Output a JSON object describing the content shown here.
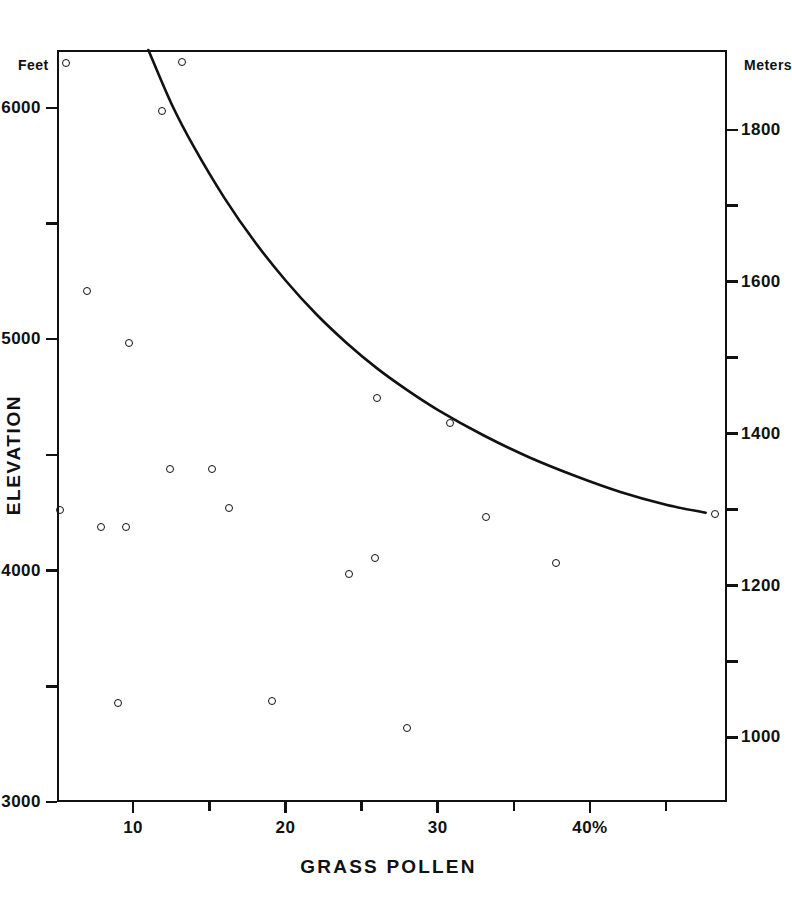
{
  "chart_data": {
    "type": "scatter",
    "title": "",
    "xlabel": "GRASS POLLEN",
    "ylabel": "ELEVATION",
    "x_unit_suffix": "%",
    "y_left_unit": "Feet",
    "y_right_unit": "Meters",
    "xlim": [
      5,
      49
    ],
    "ylim": [
      3000,
      6250
    ],
    "y_right_lim": [
      915,
      1905
    ],
    "grid": false,
    "legend": "none",
    "x_ticks": [
      10,
      20,
      30,
      40
    ],
    "x_tick_labels": [
      "10",
      "20",
      "30",
      "40%"
    ],
    "x_minor_ticks": [
      15,
      25,
      35,
      45
    ],
    "y_left_ticks": [
      3000,
      4000,
      5000,
      6000
    ],
    "y_left_tick_labels": [
      "3000",
      "4000",
      "5000",
      "6000"
    ],
    "y_left_minor_ticks": [
      3500,
      4500,
      5500
    ],
    "y_right_ticks": [
      1000,
      1200,
      1400,
      1600,
      1800
    ],
    "y_right_tick_labels": [
      "1000",
      "1200",
      "1400",
      "1600",
      "1800"
    ],
    "y_right_minor_ticks": [
      1100,
      1300,
      1500,
      1700
    ],
    "series": [
      {
        "name": "samples",
        "marker": "open-circle",
        "color": "#111111",
        "points": [
          {
            "x": 5.6,
            "y": 6195
          },
          {
            "x": 13.2,
            "y": 6200
          },
          {
            "x": 11.9,
            "y": 5985
          },
          {
            "x": 7.0,
            "y": 5210
          },
          {
            "x": 9.7,
            "y": 4985
          },
          {
            "x": 26.0,
            "y": 4745
          },
          {
            "x": 30.8,
            "y": 4640
          },
          {
            "x": 12.4,
            "y": 4440
          },
          {
            "x": 15.2,
            "y": 4440
          },
          {
            "x": 5.2,
            "y": 4260
          },
          {
            "x": 16.3,
            "y": 4270
          },
          {
            "x": 33.2,
            "y": 4230
          },
          {
            "x": 7.9,
            "y": 4190
          },
          {
            "x": 9.5,
            "y": 4190
          },
          {
            "x": 48.2,
            "y": 4245
          },
          {
            "x": 25.9,
            "y": 4055
          },
          {
            "x": 24.2,
            "y": 3985
          },
          {
            "x": 37.8,
            "y": 4035
          },
          {
            "x": 9.0,
            "y": 3430
          },
          {
            "x": 19.1,
            "y": 3435
          },
          {
            "x": 28.0,
            "y": 3320
          }
        ]
      }
    ],
    "trend_line": {
      "name": "fitted-curve",
      "color": "#111111",
      "points": [
        {
          "x": 11.0,
          "y": 6250
        },
        {
          "x": 12.5,
          "y": 6020
        },
        {
          "x": 14.0,
          "y": 5830
        },
        {
          "x": 16.0,
          "y": 5610
        },
        {
          "x": 18.0,
          "y": 5420
        },
        {
          "x": 20.0,
          "y": 5255
        },
        {
          "x": 22.0,
          "y": 5110
        },
        {
          "x": 24.0,
          "y": 4985
        },
        {
          "x": 26.0,
          "y": 4875
        },
        {
          "x": 28.0,
          "y": 4780
        },
        {
          "x": 30.0,
          "y": 4695
        },
        {
          "x": 33.0,
          "y": 4585
        },
        {
          "x": 36.0,
          "y": 4490
        },
        {
          "x": 39.0,
          "y": 4410
        },
        {
          "x": 42.0,
          "y": 4340
        },
        {
          "x": 45.0,
          "y": 4285
        },
        {
          "x": 47.6,
          "y": 4250
        }
      ]
    }
  }
}
